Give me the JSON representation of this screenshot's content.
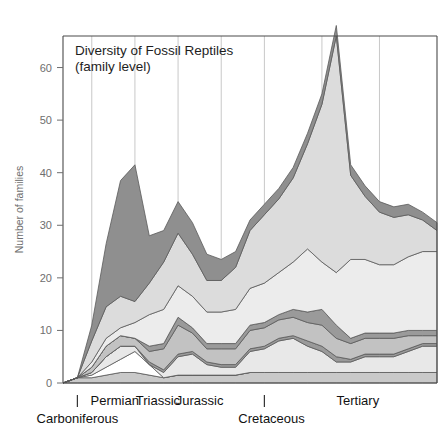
{
  "chart_data": {
    "type": "area",
    "title": "Diversity of Fossil Reptiles",
    "subtitle": "(family level)",
    "xlabel": "",
    "ylabel": "Number of families",
    "ylim": [
      0,
      66
    ],
    "yticks": [
      0,
      10,
      20,
      30,
      40,
      50,
      60
    ],
    "ytick_labels": [
      "0",
      "10",
      "20",
      "30",
      "40",
      "50",
      "60"
    ],
    "grid": "vertical period dividers only",
    "legend": "none",
    "stacked": true,
    "x": [
      0,
      1,
      2,
      3,
      4,
      5,
      6,
      7,
      8,
      9,
      10,
      11,
      12,
      13,
      14,
      15,
      16,
      17,
      18,
      19,
      20,
      21,
      22,
      23,
      24,
      25,
      26
    ],
    "period_dividers_x": [
      2,
      5,
      8,
      11,
      14,
      18,
      22
    ],
    "periods": [
      {
        "name": "Carboniferous",
        "row": 2,
        "tick_x": 1.0,
        "label_x": 1.0
      },
      {
        "name": "Permian",
        "row": 1,
        "label_x": 3.6
      },
      {
        "name": "Triassic",
        "row": 1,
        "label_x": 6.6
      },
      {
        "name": "Jurassic",
        "row": 1,
        "label_x": 9.5
      },
      {
        "name": "Cretaceous",
        "row": 2,
        "tick_x": 14.0,
        "label_x": 14.5
      },
      {
        "name": "Tertiary",
        "row": 1,
        "label_x": 20.5
      }
    ],
    "series": [
      {
        "name": "band-1-medium",
        "color": "#c9c9c9",
        "values": [
          0,
          1,
          1,
          1.5,
          2,
          2,
          1.5,
          1,
          1.5,
          1.5,
          1.5,
          1.5,
          1.5,
          2,
          2,
          2,
          2,
          2,
          2,
          2,
          2,
          2,
          2,
          2,
          2,
          2,
          2
        ]
      },
      {
        "name": "band-2-white",
        "color": "#ffffff",
        "values": [
          0,
          0,
          0.5,
          1.5,
          2.5,
          4,
          2,
          0,
          0,
          0,
          0,
          0,
          0,
          0,
          0,
          0,
          0,
          0,
          0,
          0,
          0,
          0,
          0,
          0,
          0,
          0,
          0
        ]
      },
      {
        "name": "band-3-verylight",
        "color": "#e8e8e8",
        "values": [
          0,
          0,
          0.5,
          2,
          2.5,
          1,
          0,
          1,
          3.5,
          4,
          2,
          1.5,
          1.5,
          4,
          4.5,
          6,
          6.5,
          5,
          4,
          2,
          2,
          3,
          3,
          3,
          4,
          5,
          5
        ]
      },
      {
        "name": "band-4-dark",
        "color": "#9a9a9a",
        "values": [
          0,
          0,
          0,
          0,
          0,
          0,
          0.5,
          0.5,
          0.5,
          0.5,
          0.5,
          0.5,
          0.5,
          0.5,
          0.5,
          0.5,
          0.5,
          1,
          1,
          1,
          0.5,
          0.5,
          0.5,
          0.5,
          0.5,
          0.5,
          0.5
        ]
      },
      {
        "name": "band-5-medium",
        "color": "#c2c2c2",
        "values": [
          0,
          0,
          1,
          2,
          2,
          1.5,
          2,
          4,
          5.5,
          3.5,
          2.5,
          3,
          3,
          3.5,
          3.5,
          3.5,
          3.5,
          3.5,
          4,
          3.5,
          3,
          3,
          3,
          3,
          2.5,
          1.5,
          1.5
        ]
      },
      {
        "name": "band-6-dark",
        "color": "#9a9a9a",
        "values": [
          0,
          0,
          0,
          0,
          0,
          0,
          1,
          1,
          1.5,
          1,
          1,
          1,
          1,
          1,
          1,
          1,
          1.5,
          2,
          3,
          2.5,
          1,
          1,
          1,
          1,
          1,
          1,
          1
        ]
      },
      {
        "name": "band-7-verylight",
        "color": "#ececec",
        "values": [
          0,
          0,
          1,
          1.5,
          1.5,
          3,
          6,
          6.5,
          6,
          6,
          6,
          6,
          6.5,
          7,
          7.5,
          8,
          9,
          12,
          9,
          10,
          15,
          14,
          13,
          13,
          14,
          15,
          15
        ]
      },
      {
        "name": "band-8-light",
        "color": "#dcdcdc",
        "values": [
          0,
          0,
          4,
          6,
          6,
          4,
          6,
          9,
          10,
          8,
          6,
          6,
          8,
          11,
          13,
          14,
          16,
          20,
          30,
          45,
          16,
          12,
          10,
          9,
          8,
          6,
          4
        ]
      },
      {
        "name": "band-9-dark",
        "color": "#8f8f8f",
        "values": [
          0,
          0,
          3,
          12,
          22,
          26,
          9,
          6,
          6,
          6,
          5,
          4,
          3,
          2,
          2,
          2,
          2,
          2,
          2,
          2,
          2,
          2,
          2,
          2,
          2,
          1.5,
          1.5
        ]
      }
    ],
    "peaks": [
      {
        "label": "Permian maximum",
        "x": 5,
        "value": 41
      },
      {
        "label": "Cretaceous maximum",
        "x": 19,
        "value": 64
      },
      {
        "label": "Triassic peak",
        "x": 8,
        "value": 31
      },
      {
        "label": "Late Jurassic peak",
        "x": 13,
        "value": 39
      }
    ]
  }
}
